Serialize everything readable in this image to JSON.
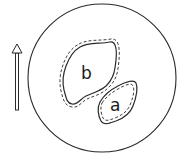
{
  "diagram": {
    "colors": {
      "stroke": "#2a2a2a",
      "background": "#ffffff"
    },
    "circle": {
      "cx": 102,
      "cy": 78,
      "r": 74
    },
    "arrow": {
      "x": 17,
      "y_tail": 110,
      "y_head": 44,
      "direction": "up"
    },
    "regions": [
      {
        "id": "b",
        "label": "b",
        "label_x": 81,
        "label_y": 79
      },
      {
        "id": "a",
        "label": "a",
        "label_x": 110,
        "label_y": 111
      }
    ]
  }
}
